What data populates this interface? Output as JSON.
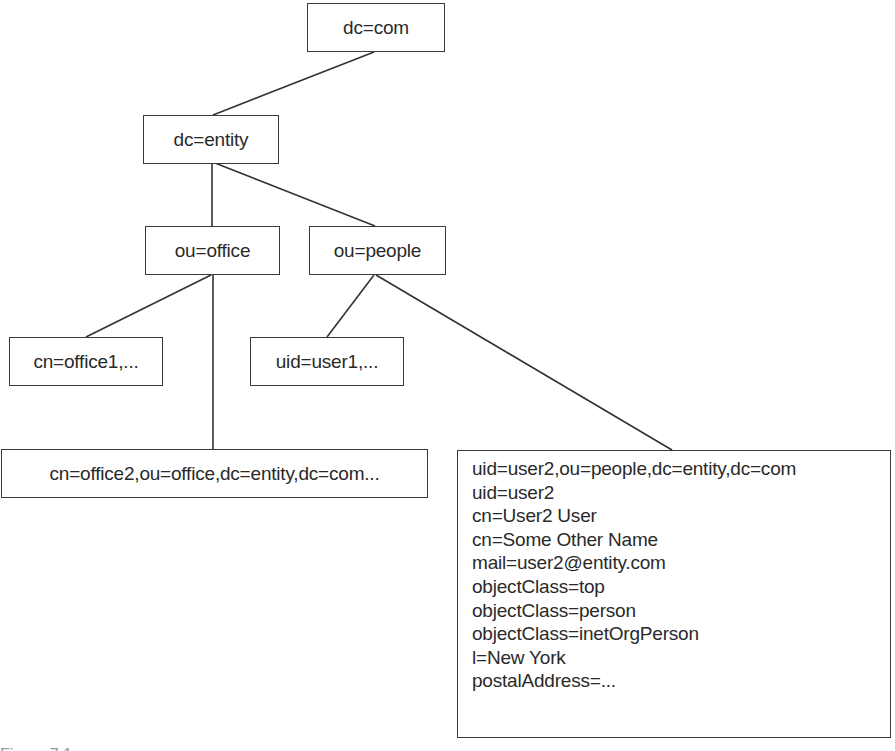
{
  "diagram": {
    "type": "ldap-directory-tree",
    "nodes": [
      {
        "id": "dc-com",
        "label": "dc=com"
      },
      {
        "id": "dc-entity",
        "label": "dc=entity"
      },
      {
        "id": "ou-office",
        "label": "ou=office"
      },
      {
        "id": "ou-people",
        "label": "ou=people"
      },
      {
        "id": "cn-office1",
        "label": "cn=office1,..."
      },
      {
        "id": "uid-user1",
        "label": "uid=user1,..."
      },
      {
        "id": "cn-office2",
        "label": "cn=office2,ou=office,dc=entity,dc=com..."
      },
      {
        "id": "uid-user2",
        "label": "uid=user2,ou=people,dc=entity,dc=com",
        "attributes": [
          "uid=user2,ou=people,dc=entity,dc=com",
          "uid=user2",
          "cn=User2 User",
          "cn=Some Other Name",
          "mail=user2@entity.com",
          "objectClass=top",
          "objectClass=person",
          "objectClass=inetOrgPerson",
          "l=New York",
          "postalAddress=..."
        ]
      }
    ],
    "edges": [
      {
        "from": "dc-com",
        "to": "dc-entity"
      },
      {
        "from": "dc-entity",
        "to": "ou-office"
      },
      {
        "from": "dc-entity",
        "to": "ou-people"
      },
      {
        "from": "ou-office",
        "to": "cn-office1"
      },
      {
        "from": "ou-office",
        "to": "cn-office2"
      },
      {
        "from": "ou-people",
        "to": "uid-user1"
      },
      {
        "from": "ou-people",
        "to": "uid-user2"
      }
    ],
    "caption_fragment": "Figure 7.1"
  }
}
